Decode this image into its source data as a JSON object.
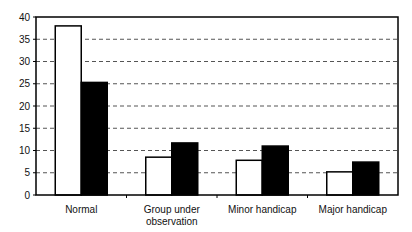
{
  "chart_data": {
    "type": "bar",
    "title": "",
    "xlabel": "",
    "ylabel": "",
    "ylim": [
      0,
      40
    ],
    "yticks": [
      0,
      5,
      10,
      15,
      20,
      25,
      30,
      35,
      40
    ],
    "grid": "horizontal dashed",
    "legend": "none",
    "categories": [
      "Normal",
      "Group under observation",
      "Minor handicap",
      "Major handicap"
    ],
    "category_lines": [
      [
        "Normal"
      ],
      [
        "Group under",
        "observation"
      ],
      [
        "Minor handicap"
      ],
      [
        "Major handicap"
      ]
    ],
    "series": [
      {
        "name": "Series 1 (white)",
        "color": "#ffffff",
        "values": [
          38,
          8.5,
          7.8,
          5.2
        ]
      },
      {
        "name": "Series 2 (black)",
        "color": "#000000",
        "values": [
          25.3,
          11.7,
          11,
          7.4
        ]
      }
    ]
  }
}
